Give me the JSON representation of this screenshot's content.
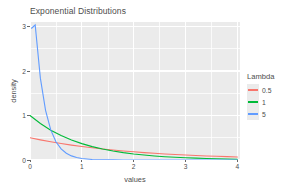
{
  "chart_data": {
    "type": "line",
    "title": "Exponential Distributions",
    "xlabel": "values",
    "ylabel": "density",
    "xlim": [
      0,
      4.05
    ],
    "ylim": [
      0,
      3.1
    ],
    "grid": true,
    "grid_color": "#ffffff",
    "panel_background": "#ebebeb",
    "x_ticks": [
      "0",
      "1",
      "2",
      "3",
      "4"
    ],
    "x_tick_values": [
      0,
      1,
      2,
      3,
      4
    ],
    "y_ticks": [
      "0",
      "1",
      "2",
      "3"
    ],
    "y_tick_values": [
      0,
      1,
      2,
      3
    ],
    "legend": {
      "title": "Lambda",
      "position": "right",
      "entries": [
        {
          "label": "0.5",
          "color": "#f8766d"
        },
        {
          "label": "1",
          "color": "#00ba38"
        },
        {
          "label": "5",
          "color": "#619cff"
        }
      ]
    },
    "series": [
      {
        "name": "0.5",
        "lambda": 0.5,
        "color": "#f8766d",
        "x": [
          0,
          0.2,
          0.4,
          0.6,
          0.8,
          1,
          1.2,
          1.4,
          1.6,
          1.8,
          2,
          2.2,
          2.4,
          2.6,
          2.8,
          3,
          3.2,
          3.4,
          3.6,
          3.8,
          4
        ],
        "values": [
          0.5,
          0.452,
          0.409,
          0.37,
          0.335,
          0.303,
          0.274,
          0.248,
          0.225,
          0.203,
          0.184,
          0.166,
          0.151,
          0.136,
          0.123,
          0.112,
          0.101,
          0.091,
          0.083,
          0.075,
          0.068
        ]
      },
      {
        "name": "1",
        "lambda": 1,
        "color": "#00ba38",
        "x": [
          0,
          0.2,
          0.4,
          0.6,
          0.8,
          1,
          1.2,
          1.4,
          1.6,
          1.8,
          2,
          2.2,
          2.4,
          2.6,
          2.8,
          3,
          3.2,
          3.4,
          3.6,
          3.8,
          4
        ],
        "values": [
          1.0,
          0.819,
          0.67,
          0.549,
          0.449,
          0.368,
          0.301,
          0.247,
          0.202,
          0.165,
          0.135,
          0.111,
          0.091,
          0.074,
          0.061,
          0.05,
          0.041,
          0.033,
          0.027,
          0.022,
          0.018
        ]
      },
      {
        "name": "5",
        "lambda": 5,
        "color": "#619cff",
        "x": [
          0.03,
          0.1,
          0.2,
          0.3,
          0.4,
          0.5,
          0.6,
          0.7,
          0.8,
          0.9,
          1,
          1.2,
          1.4,
          1.6,
          1.8,
          2,
          2.5,
          3,
          3.5,
          4
        ],
        "values": [
          2.96,
          3.033,
          1.839,
          1.116,
          0.677,
          0.41,
          0.249,
          0.151,
          0.092,
          0.056,
          0.034,
          0.012,
          0.005,
          0.002,
          0.001,
          0.0002,
          0.0,
          0.0,
          0.0,
          0.0
        ]
      }
    ]
  }
}
